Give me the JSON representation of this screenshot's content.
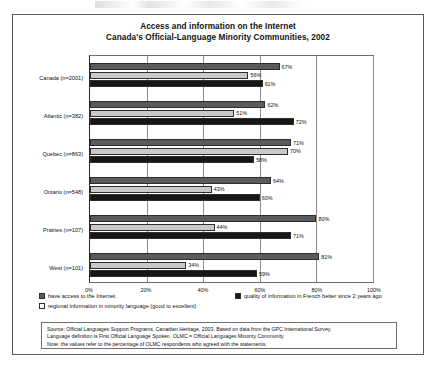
{
  "figure": {
    "title_line1": "Access and information on the Internet",
    "title_line2": "Canada's Official-Language Minority Communities, 2002"
  },
  "legend": {
    "items": [
      {
        "label": "have access to the Internet",
        "color": "#5b5b5b"
      },
      {
        "label": "quality of information in French better since 2 years ago",
        "color": "#161616"
      },
      {
        "label": "regional information in minority language (good to excellent)",
        "color": "#ffffff"
      }
    ]
  },
  "notes": {
    "line1": "Source: Official Languages Support Programs, Canadian Heritage, 2003.  Based on data from the GPC International Survey.",
    "line2": "Language definition is First Official Language Spoken.  OLMC = Official Languages Minority Community",
    "line3": "Note:  the values refer to the percentage of OLMC respondents who agreed with the statements."
  },
  "chart_data": {
    "type": "bar",
    "orientation": "horizontal",
    "xlabel": "",
    "ylabel": "",
    "xlim": [
      0,
      100
    ],
    "xticks": [
      "0%",
      "20%",
      "40%",
      "60%",
      "80%",
      "100%"
    ],
    "xtick_values": [
      0,
      20,
      40,
      60,
      80,
      100
    ],
    "grid": true,
    "legend_position": "below",
    "categories": [
      "Canada (n=2001)",
      "Atlantic (n=382)",
      "Quebec (n=863)",
      "Ontario (n=548)",
      "Prairies (n=107)",
      "West (n=101)"
    ],
    "series": [
      {
        "name": "have access to the Internet",
        "color": "#5b5b5b",
        "values": [
          67,
          62,
          71,
          64,
          80,
          81
        ],
        "labels": [
          "67%",
          "62%",
          "71%",
          "64%",
          "80%",
          "81%"
        ]
      },
      {
        "name": "regional information in minority language (good to excellent)",
        "color": "#c9c9c9",
        "values": [
          56,
          51,
          70,
          43,
          44,
          34
        ],
        "labels": [
          "56%",
          "51%",
          "70%",
          "43%",
          "44%",
          "34%"
        ]
      },
      {
        "name": "quality of information in French better since 2 years ago",
        "color": "#161616",
        "values": [
          61,
          72,
          58,
          60,
          71,
          59
        ],
        "labels": [
          "61%",
          "72%",
          "58%",
          "60%",
          "71%",
          "59%"
        ]
      }
    ]
  }
}
